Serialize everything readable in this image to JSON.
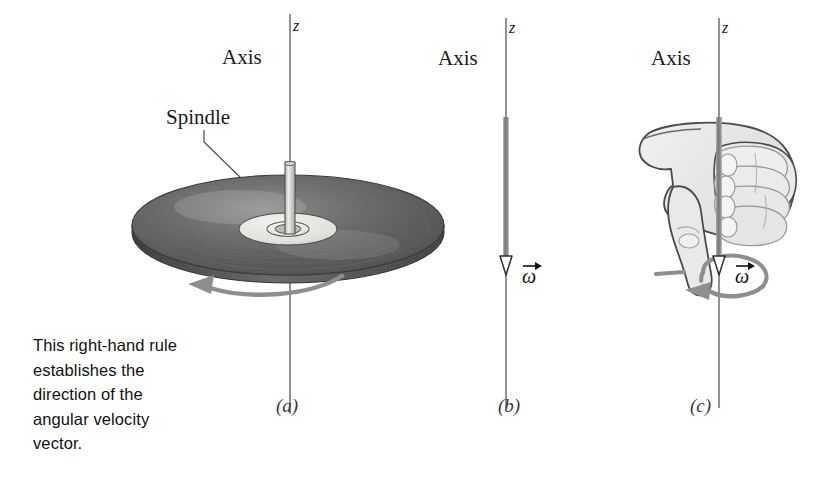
{
  "figure": {
    "kind": "physics-textbook-figure",
    "topic": "Right-hand rule for angular velocity vector",
    "background_color": "#ffffff",
    "caption": "This right-hand rule\nestablishes the\ndirection of the\nangular velocity\nvector.",
    "caption_lines": [
      "This right-hand rule",
      "establishes the",
      "direction of the",
      "angular velocity",
      "vector."
    ]
  },
  "colors": {
    "ink": "#1a1a1a",
    "axis_line": "#6d6d6d",
    "vector_shaft": "#8c8c8c",
    "rotation_arrow": "#8e8e8e",
    "disk_dark": "#5c5c5c",
    "disk_mid": "#6f6f6f",
    "disk_light": "#8a8a8a",
    "disk_label": "#e3e3e0",
    "spindle": "#d8d8d6",
    "hand_fill": "#e9e9e9",
    "hand_outline": "#4a4a4a",
    "caption_text": "#111111"
  },
  "panels": [
    {
      "id": "a",
      "label": "(a)",
      "axis_label": "Axis",
      "z_label": "z",
      "annotation_label": "Spindle",
      "object": "spinning-disk",
      "rotation_arrow": "counterclockwise-viewed-from-above",
      "description": "A phonograph record spinning on a spindle about the z axis"
    },
    {
      "id": "b",
      "label": "(b)",
      "axis_label": "Axis",
      "z_label": "z",
      "vector_symbol": "ω",
      "vector_direction": "down",
      "description": "Angular velocity vector drawn along the axis pointing downward"
    },
    {
      "id": "c",
      "label": "(c)",
      "axis_label": "Axis",
      "z_label": "z",
      "vector_symbol": "ω",
      "vector_direction": "down",
      "object": "right-hand",
      "rotation_arrow": "counterclockwise-viewed-from-above",
      "description": "Right hand with curled fingers and thumb pointing down along omega"
    }
  ]
}
